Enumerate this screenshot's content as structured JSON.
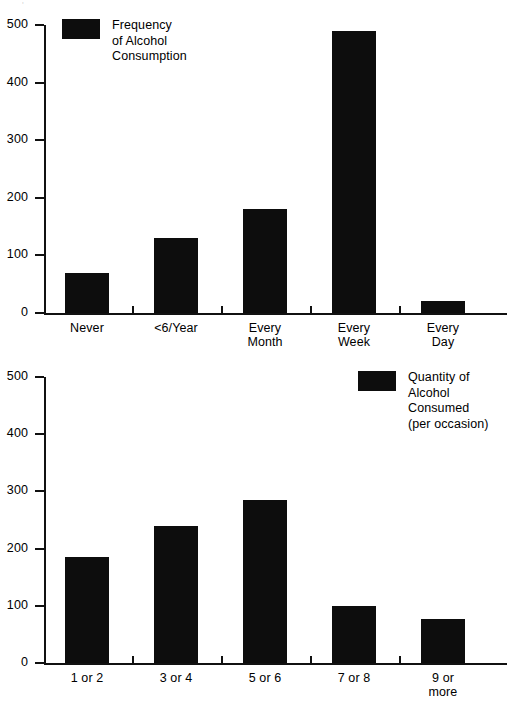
{
  "page": {
    "background_color": "#ffffff",
    "ink_color": "#0d0d0d",
    "artifact_mark": "'"
  },
  "chart_data": [
    {
      "id": "frequency-of-alcohol-consumption",
      "type": "bar",
      "title": "",
      "legend_label": "Frequency\nof Alcohol\nConsumption",
      "legend_position": "top-left",
      "xlabel": "",
      "ylabel": "",
      "grid": false,
      "ylim": [
        0,
        500
      ],
      "yticks": [
        0,
        100,
        200,
        300,
        400,
        500
      ],
      "ytick_labels": [
        "0",
        "100",
        "200",
        "300",
        "400",
        "500"
      ],
      "categories": [
        "Never",
        "<6/Year",
        "Every\nMonth",
        "Every\nWeek",
        "Every\nDay"
      ],
      "values": [
        70,
        130,
        180,
        490,
        20
      ]
    },
    {
      "id": "quantity-of-alcohol-consumed",
      "type": "bar",
      "title": "",
      "legend_label": "Quantity of\nAlcohol\nConsumed\n(per occasion)",
      "legend_position": "top-right",
      "xlabel": "",
      "ylabel": "",
      "grid": false,
      "ylim": [
        0,
        500
      ],
      "yticks": [
        0,
        100,
        200,
        300,
        400,
        500
      ],
      "ytick_labels": [
        "0",
        "100",
        "200",
        "300",
        "400",
        "500"
      ],
      "categories": [
        "1 or 2",
        "3 or 4",
        "5 or 6",
        "7 or 8",
        "9 or\nmore"
      ],
      "values": [
        185,
        240,
        285,
        100,
        77
      ]
    }
  ]
}
